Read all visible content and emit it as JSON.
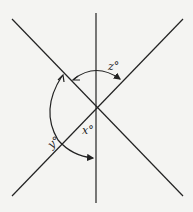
{
  "diagram": {
    "lines": [
      {
        "name": "vertical-line",
        "x1": 96,
        "y1": 13,
        "x2": 96,
        "y2": 203
      },
      {
        "name": "diagonal-line-descending",
        "x1": 12,
        "y1": 19,
        "x2": 183,
        "y2": 196
      },
      {
        "name": "diagonal-line-ascending",
        "x1": 183,
        "y1": 19,
        "x2": 12,
        "y2": 196
      }
    ],
    "intersection": {
      "x": 96,
      "y": 107
    },
    "labels": {
      "z": "z°",
      "y": "y°",
      "x": "x°"
    },
    "colors": {
      "background": "#f4f4f2",
      "stroke": "#222222"
    }
  }
}
